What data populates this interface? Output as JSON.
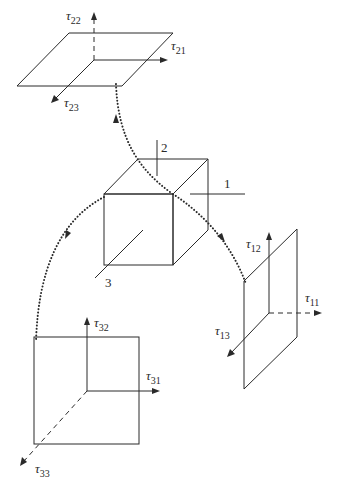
{
  "diagram": {
    "title": "",
    "cube_axes": {
      "axis_1": "1",
      "axis_2": "2",
      "axis_3": "3"
    },
    "planes": [
      {
        "name": "face-normal-2",
        "position": "top",
        "components": [
          {
            "symbol": "τ",
            "sub": "22",
            "direction": "normal",
            "line": "dashed"
          },
          {
            "symbol": "τ",
            "sub": "21",
            "direction": "shear",
            "line": "solid"
          },
          {
            "symbol": "τ",
            "sub": "23",
            "direction": "shear",
            "line": "solid"
          }
        ]
      },
      {
        "name": "face-normal-1",
        "position": "right",
        "components": [
          {
            "symbol": "τ",
            "sub": "11",
            "direction": "normal",
            "line": "dashed"
          },
          {
            "symbol": "τ",
            "sub": "12",
            "direction": "shear",
            "line": "solid"
          },
          {
            "symbol": "τ",
            "sub": "13",
            "direction": "shear",
            "line": "solid"
          }
        ]
      },
      {
        "name": "face-normal-3",
        "position": "bottom-left",
        "components": [
          {
            "symbol": "τ",
            "sub": "33",
            "direction": "normal",
            "line": "dashed"
          },
          {
            "symbol": "τ",
            "sub": "31",
            "direction": "shear",
            "line": "solid"
          },
          {
            "symbol": "τ",
            "sub": "32",
            "direction": "shear",
            "line": "solid"
          }
        ]
      }
    ],
    "connectors": [
      {
        "from": "cube-top-face",
        "to": "face-normal-2",
        "style": "dotted-arrow"
      },
      {
        "from": "cube-right-face",
        "to": "face-normal-1",
        "style": "dotted-arrow"
      },
      {
        "from": "cube-front-face",
        "to": "face-normal-3",
        "style": "dotted-arrow"
      }
    ]
  }
}
